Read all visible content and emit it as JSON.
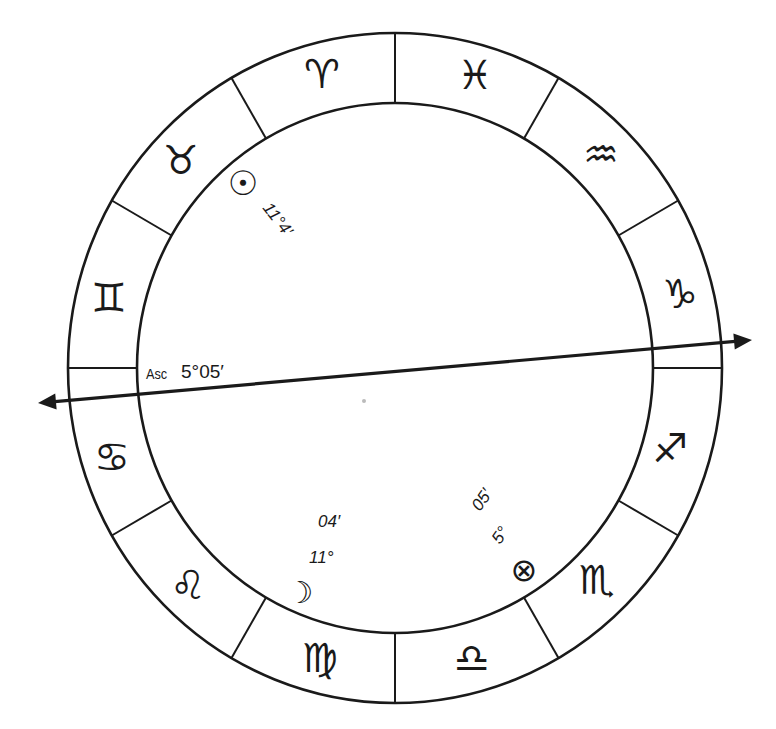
{
  "chart": {
    "center": {
      "x": 395,
      "y": 368
    },
    "outer": {
      "rx": 327,
      "ry": 335
    },
    "inner": {
      "rx": 258,
      "ry": 265
    },
    "line_color": "#1a1a1a",
    "signs": [
      {
        "name": "aries",
        "glyph": "♈",
        "x": 322,
        "y": 74
      },
      {
        "name": "pisces",
        "glyph": "♓",
        "x": 475,
        "y": 75
      },
      {
        "name": "aquarius",
        "glyph": "♒",
        "x": 601,
        "y": 154
      },
      {
        "name": "capricorn",
        "glyph": "♑",
        "x": 680,
        "y": 294
      },
      {
        "name": "sagittarius",
        "glyph": "♐",
        "x": 670,
        "y": 448
      },
      {
        "name": "scorpio",
        "glyph": "♏",
        "x": 597,
        "y": 580
      },
      {
        "name": "libra",
        "glyph": "♎",
        "x": 472,
        "y": 658
      },
      {
        "name": "virgo",
        "glyph": "♍",
        "x": 320,
        "y": 658
      },
      {
        "name": "leo",
        "glyph": "♌",
        "x": 188,
        "y": 585
      },
      {
        "name": "cancer",
        "glyph": "♋",
        "x": 112,
        "y": 457
      },
      {
        "name": "gemini",
        "glyph": "♊",
        "x": 109,
        "y": 298
      },
      {
        "name": "taurus",
        "glyph": "♉",
        "x": 181,
        "y": 160
      }
    ],
    "planets": [
      {
        "name": "sun",
        "glyph": "☉",
        "x": 243,
        "y": 183,
        "size": 34,
        "label": "11°4′",
        "label_x": 262,
        "label_y": 208,
        "label_rotate": 52
      },
      {
        "name": "moon",
        "glyph": "☽",
        "x": 300,
        "y": 592,
        "size": 30,
        "label_deg": "11°",
        "label_min": "04′",
        "deg_x": 309,
        "deg_y": 563,
        "min_x": 318,
        "min_y": 527
      },
      {
        "name": "part-of-fortune",
        "glyph": "⊗",
        "x": 524,
        "y": 570,
        "size": 32,
        "label_deg": "5°",
        "label_min": "05′",
        "deg_x": 500,
        "deg_y": 545,
        "min_x": 480,
        "min_y": 512,
        "label_rotate": -55
      }
    ],
    "ascendant": {
      "label": "Asc",
      "value": "5°05′",
      "line": {
        "x1": 38,
        "y1": 403,
        "x2": 752,
        "y2": 340
      }
    },
    "center_dot": {
      "x": 364,
      "y": 401,
      "color": "#bbbbbb"
    }
  }
}
